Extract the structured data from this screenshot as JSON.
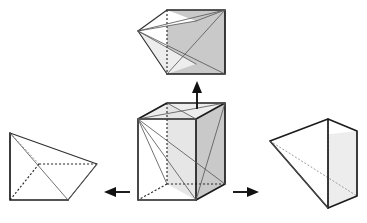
{
  "figure": {
    "background_color": "#ffffff",
    "width": 367,
    "height": 223,
    "caption": ""
  },
  "palette": {
    "edge_color": "#303030",
    "edge_heavy_color": "#1c1c1c",
    "thin_edge_color": "#5a5a5a",
    "hidden_edge_color": "#2a2a2a",
    "shade_dark": "#c9c9c9",
    "shade_mid": "#d5d5d5",
    "shade_light": "#e2e2e2",
    "shade_pale": "#ededed",
    "arrow_color": "#111111"
  },
  "shapes": [
    {
      "id": "cube",
      "name": "central-cube",
      "label": "",
      "role": "source-solid",
      "position": "center",
      "description": "Cube drawn in oblique projection with an interior apex vertex at the left-middle, from which diagonals radiate to the far corners."
    },
    {
      "id": "pyramid-top",
      "name": "pyramid-top",
      "label": "",
      "role": "decomposition-part",
      "position": "top",
      "description": "Square pyramid whose square base is the shaded right face of the cube and whose apex points left."
    },
    {
      "id": "pyramid-left",
      "name": "pyramid-left",
      "label": "",
      "role": "decomposition-part",
      "position": "left",
      "description": "Square pyramid whose square base is the bottom face of the cube and whose apex is raised at the upper-left."
    },
    {
      "id": "pyramid-right",
      "name": "pyramid-right",
      "label": "",
      "role": "decomposition-part",
      "position": "right",
      "description": "Square pyramid whose square base is the back face of the cube and whose apex points to the lower-left."
    }
  ],
  "arrows": [
    {
      "id": "arrow-up",
      "name": "arrow-up",
      "direction": "up",
      "from": "cube",
      "to": "pyramid-top",
      "label": ""
    },
    {
      "id": "arrow-left",
      "name": "arrow-left",
      "direction": "left",
      "from": "cube",
      "to": "pyramid-left",
      "label": ""
    },
    {
      "id": "arrow-right",
      "name": "arrow-right",
      "direction": "right",
      "from": "cube",
      "to": "pyramid-right",
      "label": ""
    }
  ]
}
